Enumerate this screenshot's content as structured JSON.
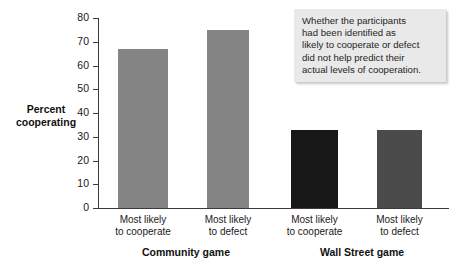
{
  "chart_data": {
    "type": "bar",
    "title": "",
    "xlabel": "",
    "ylabel": "Percent cooperating",
    "ylim": [
      0,
      80
    ],
    "yticks": [
      0,
      10,
      20,
      30,
      40,
      50,
      60,
      70,
      80
    ],
    "grid": false,
    "legend": "none",
    "categories": [
      "Most likely to cooperate",
      "Most likely to defect",
      "Most likely to cooperate",
      "Most likely to defect"
    ],
    "groups": [
      "Community game",
      "Wall Street game"
    ],
    "values": [
      67,
      75,
      33,
      33
    ],
    "bar_colors": [
      "#848484",
      "#848484",
      "#171717",
      "#4b4b4b"
    ],
    "annotation": "Whether the participants had been identified as likely to cooperate or defect did not help predict their actual levels of cooperation."
  },
  "axis": {
    "y_title_line1": "Percent",
    "y_title_line2": "cooperating",
    "ticks": [
      "80",
      "70",
      "60",
      "50",
      "40",
      "30",
      "20",
      "10",
      "0"
    ]
  },
  "bars": [
    {
      "label_line1": "Most likely",
      "label_line2": "to cooperate",
      "value": 67,
      "color": "#848484"
    },
    {
      "label_line1": "Most likely",
      "label_line2": "to defect",
      "value": 75,
      "color": "#848484"
    },
    {
      "label_line1": "Most likely",
      "label_line2": "to cooperate",
      "value": 33,
      "color": "#171717"
    },
    {
      "label_line1": "Most likely",
      "label_line2": "to defect",
      "value": 33,
      "color": "#4b4b4b"
    }
  ],
  "groups": [
    {
      "label": "Community game"
    },
    {
      "label": "Wall Street game"
    }
  ],
  "callout": {
    "line1": "Whether the participants",
    "line2": "had been identified as",
    "line3": "likely to cooperate or defect",
    "line4": "did not help predict their",
    "line5": "actual levels of cooperation."
  },
  "colors": {
    "axis": "#3b3b3b",
    "text": "#1a1a1a",
    "callout_bg": "#e9e9e9",
    "bar_light_grey": "#848484",
    "bar_black": "#171717",
    "bar_dark_grey": "#4b4b4b"
  }
}
